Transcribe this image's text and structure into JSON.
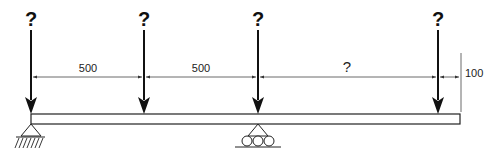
{
  "diagram": {
    "type": "beam-loading",
    "loads": [
      {
        "label": "?",
        "x": 31
      },
      {
        "label": "?",
        "x": 144
      },
      {
        "label": "?",
        "x": 258
      },
      {
        "label": "?",
        "x": 438
      }
    ],
    "dimensions": [
      {
        "label": "500",
        "from_load": 1,
        "to_load": 2
      },
      {
        "label": "500",
        "from_load": 2,
        "to_load": 3
      },
      {
        "label": "?",
        "from_load": 3,
        "to_load": 4
      },
      {
        "label": "100",
        "from_load": 4,
        "to": "beam-end"
      }
    ],
    "supports": [
      {
        "type": "pin",
        "at_load": 1
      },
      {
        "type": "roller",
        "at_load": 3
      }
    ]
  }
}
